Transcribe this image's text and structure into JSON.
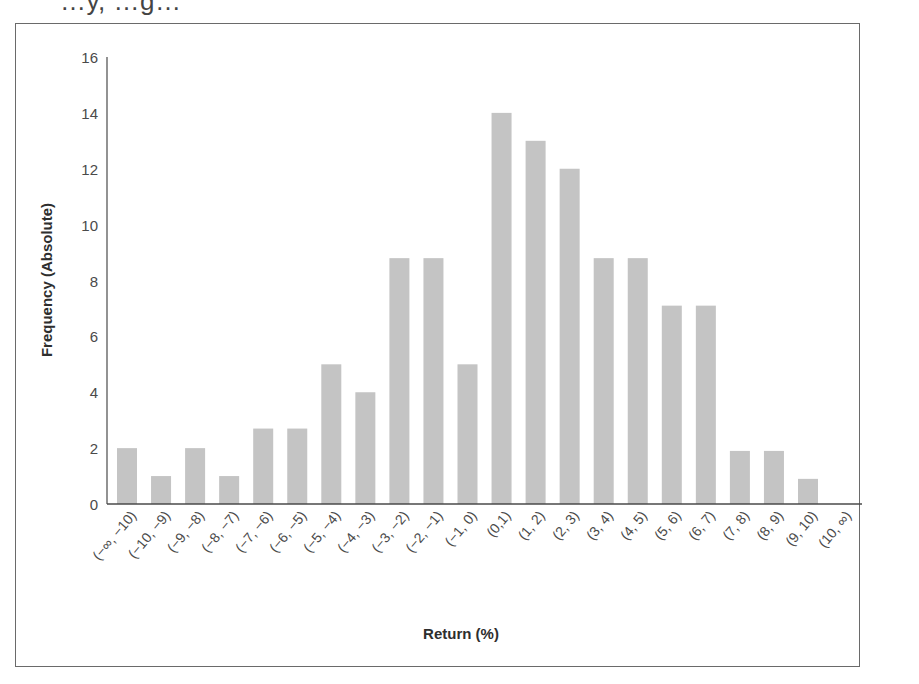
{
  "caption_fragment": "…y, …g…",
  "chart_data": {
    "type": "bar",
    "title": "",
    "xlabel": "Return (%)",
    "ylabel": "Frequency (Absolute)",
    "ylim": [
      0,
      16
    ],
    "yticks": [
      0,
      2,
      4,
      6,
      8,
      10,
      12,
      14,
      16
    ],
    "grid": false,
    "legend": null,
    "bar_color": "#c4c4c4",
    "categories": [
      "(−∞, −10)",
      "(−10, −9)",
      "(−9, −8)",
      "(−8, −7)",
      "(−7, −6)",
      "(−6, −5)",
      "(−5, −4)",
      "(−4, −3)",
      "(−3, −2)",
      "(−2, −1)",
      "(−1, 0)",
      "(0,1)",
      "(1, 2)",
      "(2, 3)",
      "(3, 4)",
      "(4, 5)",
      "(5, 6)",
      "(6, 7)",
      "(7, 8)",
      "(8, 9)",
      "(9, 10)",
      "(10, ∞)"
    ],
    "values": [
      2,
      1,
      2,
      1,
      2.7,
      2.7,
      5,
      4,
      8.8,
      8.8,
      5,
      14,
      13,
      12,
      8.8,
      8.8,
      7.1,
      7.1,
      1.9,
      1.9,
      0.9,
      0
    ]
  }
}
